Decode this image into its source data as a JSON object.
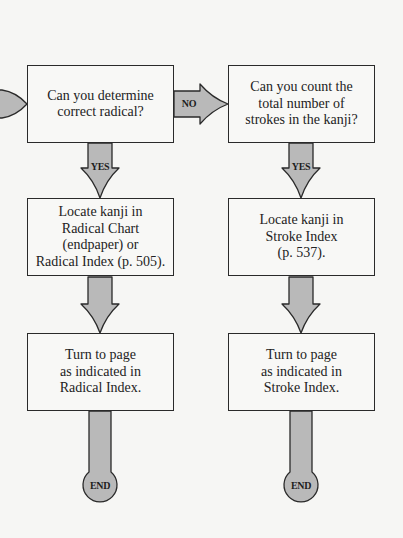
{
  "diagram": {
    "type": "flowchart",
    "colors": {
      "arrow_fill": "#b9b9b9",
      "stroke": "#2a2a2a",
      "box_fill": "#f8f8f6",
      "background": "#f6f6f4"
    },
    "nodes": [
      {
        "id": "q_radical",
        "text": "Can you determine\ncorrect radical?"
      },
      {
        "id": "q_strokes",
        "text": "Can you count the\ntotal number of\nstrokes in the kanji?"
      },
      {
        "id": "locate_radical",
        "text": "Locate kanji in\nRadical Chart\n(endpaper) or\nRadical Index (p. 505)."
      },
      {
        "id": "locate_stroke",
        "text": "Locate kanji in\nStroke Index\n(p. 537)."
      },
      {
        "id": "turn_radical",
        "text": "Turn to page\nas indicated in\nRadical Index."
      },
      {
        "id": "turn_stroke",
        "text": "Turn to page\nas indicated in\nStroke Index."
      }
    ],
    "edges": [
      {
        "from": "start",
        "to": "q_radical",
        "label": ""
      },
      {
        "from": "q_radical",
        "to": "q_strokes",
        "label": "NO"
      },
      {
        "from": "q_radical",
        "to": "locate_radical",
        "label": "YES"
      },
      {
        "from": "q_strokes",
        "to": "locate_stroke",
        "label": "YES"
      },
      {
        "from": "locate_radical",
        "to": "turn_radical",
        "label": ""
      },
      {
        "from": "locate_stroke",
        "to": "turn_stroke",
        "label": ""
      },
      {
        "from": "turn_radical",
        "to": "end_left",
        "label": "END"
      },
      {
        "from": "turn_stroke",
        "to": "end_right",
        "label": "END"
      }
    ],
    "labels": {
      "no": "NO",
      "yes": "YES",
      "end": "END"
    }
  }
}
